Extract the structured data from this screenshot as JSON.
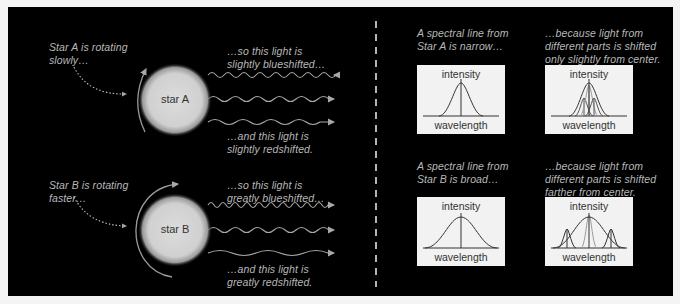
{
  "left": {
    "starA": {
      "label": "star A",
      "rotation_caption": [
        "Star A is rotating",
        "slowly…"
      ],
      "blue_caption": [
        "…so this light is",
        "slightly blueshifted…"
      ],
      "red_caption": [
        "…and this light is",
        "slightly redshifted."
      ]
    },
    "starB": {
      "label": "star B",
      "rotation_caption": [
        "Star B is rotating",
        "faster…"
      ],
      "blue_caption": [
        "…so this light is",
        "greatly blueshifted…"
      ],
      "red_caption": [
        "…and this light is",
        "greatly redshifted."
      ]
    }
  },
  "right": {
    "rowA": {
      "left_caption": [
        "A spectral line from",
        "Star A is narrow…"
      ],
      "right_caption": [
        "…because light from",
        "different parts is shifted",
        "only slightly from center."
      ]
    },
    "rowB": {
      "left_caption": [
        "A spectral line from",
        "Star B is broad…"
      ],
      "right_caption": [
        "…because light from",
        "different parts is shifted",
        "farther from center."
      ]
    },
    "graph": {
      "y_label": "intensity",
      "x_label": "wavelength"
    }
  },
  "colors": {
    "background": "#000000",
    "caption": "#b8b8b8",
    "wave": "#a8a8a8",
    "star": "#d8d8d8",
    "graph_box": "#f2f2f2"
  }
}
